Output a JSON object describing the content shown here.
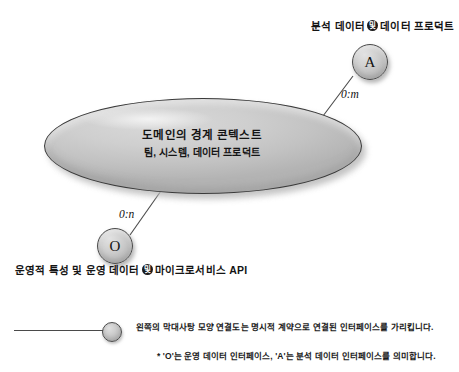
{
  "diagram": {
    "title_visible": false,
    "bounded_context": {
      "title": "도메인의 경계 콘텍스트",
      "subtitle": "팀, 시스템, 데이터 프로덕트"
    },
    "nodes": [
      {
        "id": "analytical",
        "symbol": "A",
        "cardinality": "0:m",
        "label_prefix": "분석 데이터",
        "label_badge": "및",
        "label_suffix": "데이터 프로덕트"
      },
      {
        "id": "operational",
        "symbol": "O",
        "cardinality": "0:n",
        "label_prefix": "운영적 특성 및 운영 데이터",
        "label_badge": "및",
        "label_suffix": "마이크로서비스 API"
      }
    ],
    "legend": {
      "symbol_name": "lollipop-connector",
      "note_1": "왼쪽의 막대사탕 모양 연결도는 명시적 계약으로 연결된 인터페이스를 가리킵니다.",
      "note_2": "* 'O'는 운영 데이터 인터페이스, 'A'는 분석 데이터 인터페이스를 의미합니다."
    },
    "colors": {
      "stroke": "#4a4a4a",
      "fill_light": "#d9d9d9",
      "fill_dark": "#a8a8a8",
      "text": "#141414",
      "badge_bg": "#1b1b1b"
    }
  }
}
